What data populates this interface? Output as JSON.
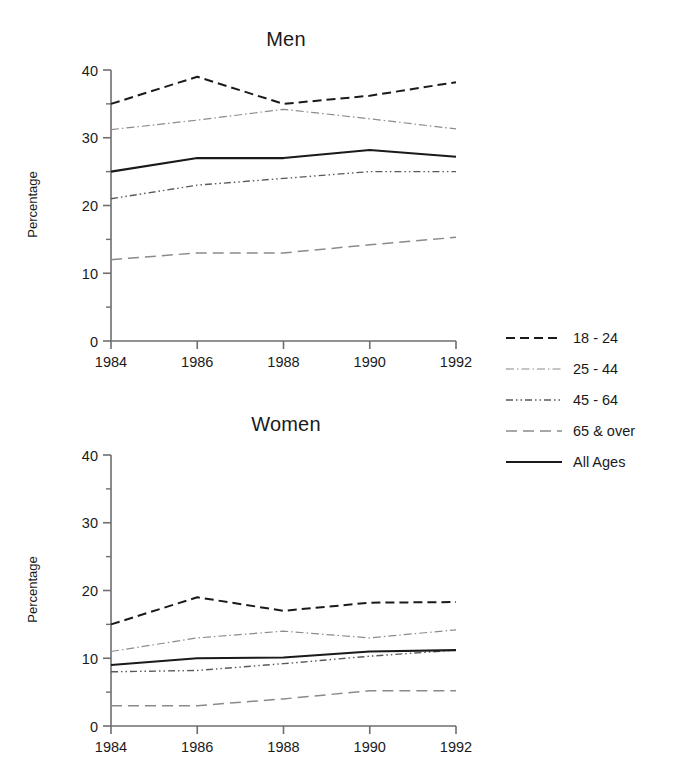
{
  "figure": {
    "background": "#ffffff",
    "ink": "#1a1a1a"
  },
  "panels": [
    {
      "key": "men",
      "title": "Men",
      "ylabel": "Percentage"
    },
    {
      "key": "women",
      "title": "Women",
      "ylabel": "Percentage"
    }
  ],
  "legend": {
    "entries": [
      {
        "label": "18 - 24",
        "style": "dashed",
        "color": "#1a1a1a"
      },
      {
        "label": "25 - 44",
        "style": "dash-dot-fine",
        "color": "#8c8c8c"
      },
      {
        "label": "45 - 64",
        "style": "dash-dot-dot",
        "color": "#5a5a5a"
      },
      {
        "label": "65 & over",
        "style": "long-dash",
        "color": "#8a8a8a"
      },
      {
        "label": "All Ages",
        "style": "solid",
        "color": "#1a1a1a"
      }
    ]
  },
  "chart_data": [
    {
      "type": "line",
      "title": "Men",
      "xlabel": "",
      "ylabel": "Percentage",
      "x": [
        1984,
        1986,
        1988,
        1990,
        1992
      ],
      "xtick_labels": [
        "1984",
        "1986",
        "1988",
        "1990",
        "1992"
      ],
      "ytick_labels": [
        "0",
        "10",
        "20",
        "30",
        "40"
      ],
      "yticks": [
        0,
        10,
        20,
        30,
        40
      ],
      "yminor": [
        5,
        15,
        25,
        35
      ],
      "ylim": [
        0,
        40
      ],
      "grid": false,
      "legend_position": "right-outside",
      "series": [
        {
          "name": "18 - 24",
          "values": [
            35.0,
            39.0,
            35.0,
            36.2,
            38.2
          ],
          "style": "dashed",
          "color": "#1a1a1a"
        },
        {
          "name": "25 - 44",
          "values": [
            31.2,
            32.6,
            34.2,
            32.8,
            31.3
          ],
          "style": "dash-dot-fine",
          "color": "#8c8c8c"
        },
        {
          "name": "45 - 64",
          "values": [
            21.0,
            23.0,
            24.0,
            25.0,
            25.0
          ],
          "style": "dash-dot-dot",
          "color": "#5a5a5a"
        },
        {
          "name": "65 & over",
          "values": [
            12.0,
            13.0,
            13.0,
            14.2,
            15.3
          ],
          "style": "long-dash",
          "color": "#8a8a8a"
        },
        {
          "name": "All Ages",
          "values": [
            25.0,
            27.0,
            27.0,
            28.2,
            27.2
          ],
          "style": "solid",
          "color": "#1a1a1a"
        }
      ]
    },
    {
      "type": "line",
      "title": "Women",
      "xlabel": "",
      "ylabel": "Percentage",
      "x": [
        1984,
        1986,
        1988,
        1990,
        1992
      ],
      "xtick_labels": [
        "1984",
        "1986",
        "1988",
        "1990",
        "1992"
      ],
      "ytick_labels": [
        "0",
        "10",
        "20",
        "30",
        "40"
      ],
      "yticks": [
        0,
        10,
        20,
        30,
        40
      ],
      "yminor": [
        5,
        15,
        25,
        35
      ],
      "ylim": [
        0,
        40
      ],
      "grid": false,
      "legend_position": "right-outside",
      "series": [
        {
          "name": "18 - 24",
          "values": [
            15.0,
            19.0,
            17.0,
            18.2,
            18.3
          ],
          "style": "dashed",
          "color": "#1a1a1a"
        },
        {
          "name": "25 - 44",
          "values": [
            11.0,
            13.0,
            14.0,
            13.0,
            14.2
          ],
          "style": "dash-dot-fine",
          "color": "#8c8c8c"
        },
        {
          "name": "45 - 64",
          "values": [
            8.0,
            8.2,
            9.2,
            10.3,
            11.2
          ],
          "style": "dash-dot-dot",
          "color": "#5a5a5a"
        },
        {
          "name": "65 & over",
          "values": [
            3.0,
            3.0,
            4.0,
            5.2,
            5.2
          ],
          "style": "long-dash",
          "color": "#8a8a8a"
        },
        {
          "name": "All Ages",
          "values": [
            9.0,
            10.0,
            10.1,
            11.0,
            11.2
          ],
          "style": "solid",
          "color": "#1a1a1a"
        }
      ]
    }
  ]
}
